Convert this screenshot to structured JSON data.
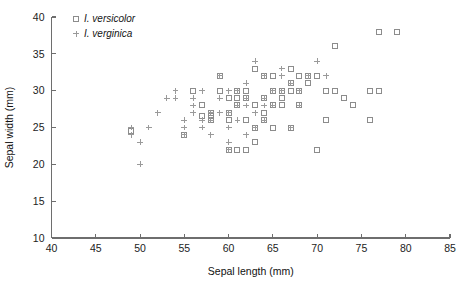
{
  "chart_data": {
    "type": "scatter",
    "title": "",
    "xlabel": "Sepal length (mm)",
    "ylabel": "Sepal width (mm)",
    "xlim": [
      40,
      85
    ],
    "ylim": [
      10,
      40
    ],
    "xticks": [
      40,
      45,
      50,
      55,
      60,
      65,
      70,
      75,
      80,
      85
    ],
    "yticks": [
      10,
      15,
      20,
      25,
      30,
      35,
      40
    ],
    "grid": false,
    "legend_position": "top-left",
    "series": [
      {
        "name": "I. versicolor",
        "marker": "square",
        "color": "#8c8c8c",
        "points": [
          [
            49,
            24.5
          ],
          [
            57,
            26.5
          ],
          [
            58,
            26.5
          ],
          [
            60,
            22.0
          ],
          [
            61,
            22.0
          ],
          [
            58,
            27.0
          ],
          [
            59,
            30.0
          ],
          [
            60,
            27.0
          ],
          [
            61,
            28.0
          ],
          [
            62,
            29.0
          ],
          [
            63,
            25.0
          ],
          [
            64,
            29.0
          ],
          [
            65,
            28.0
          ],
          [
            66,
            30.0
          ],
          [
            67,
            30.0
          ],
          [
            60,
            29.0
          ],
          [
            61,
            30.0
          ],
          [
            62,
            22.0
          ],
          [
            63,
            23.0
          ],
          [
            64,
            32.0
          ],
          [
            65,
            30.0
          ],
          [
            66,
            29.0
          ],
          [
            67,
            31.0
          ],
          [
            68,
            28.0
          ],
          [
            69,
            31.0
          ],
          [
            70,
            32.0
          ],
          [
            71,
            30.0
          ],
          [
            72,
            36.0
          ],
          [
            70,
            22.0
          ],
          [
            63,
            33.0
          ],
          [
            64,
            26.0
          ],
          [
            66,
            30.0
          ],
          [
            56,
            30.0
          ],
          [
            57,
            28.0
          ],
          [
            55,
            24.0
          ],
          [
            58,
            26.0
          ],
          [
            59,
            32.0
          ],
          [
            61,
            29.0
          ],
          [
            62,
            30.0
          ],
          [
            63,
            28.0
          ],
          [
            65,
            32.0
          ],
          [
            67,
            33.0
          ],
          [
            68,
            30.0
          ],
          [
            76,
            30.0
          ],
          [
            77,
            30.0
          ],
          [
            76,
            26.0
          ],
          [
            77,
            38.0
          ],
          [
            79,
            38.0
          ],
          [
            73,
            29.0
          ],
          [
            74,
            28.0
          ],
          [
            72,
            30.0
          ],
          [
            71,
            26.0
          ],
          [
            69,
            32.0
          ],
          [
            68,
            32.0
          ],
          [
            66,
            28.0
          ],
          [
            64,
            27.0
          ],
          [
            62,
            26.0
          ],
          [
            60,
            26.0
          ],
          [
            67,
            25.0
          ],
          [
            65,
            25.0
          ]
        ]
      },
      {
        "name": "I. verginica",
        "marker": "plus",
        "color": "#9a9a9a",
        "points": [
          [
            49,
            25.0
          ],
          [
            49,
            24.0
          ],
          [
            50,
            23.0
          ],
          [
            50,
            20.0
          ],
          [
            51,
            25.0
          ],
          [
            52,
            27.0
          ],
          [
            54,
            30.0
          ],
          [
            55,
            26.0
          ],
          [
            55,
            24.0
          ],
          [
            56,
            29.0
          ],
          [
            56,
            28.0
          ],
          [
            57,
            30.0
          ],
          [
            57,
            26.0
          ],
          [
            57,
            25.0
          ],
          [
            58,
            27.0
          ],
          [
            58,
            26.0
          ],
          [
            59,
            32.0
          ],
          [
            60,
            30.0
          ],
          [
            60,
            27.0
          ],
          [
            60,
            22.0
          ],
          [
            61,
            28.0
          ],
          [
            61,
            30.0
          ],
          [
            62,
            28.0
          ],
          [
            62,
            29.0
          ],
          [
            63,
            34.0
          ],
          [
            63,
            25.0
          ],
          [
            64,
            28.0
          ],
          [
            64,
            32.0
          ],
          [
            65,
            30.0
          ],
          [
            65,
            28.0
          ],
          [
            66,
            30.0
          ],
          [
            67,
            31.0
          ],
          [
            67,
            25.0
          ],
          [
            68,
            30.0
          ],
          [
            69,
            32.0
          ],
          [
            70,
            34.0
          ],
          [
            71,
            32.0
          ],
          [
            55,
            25.0
          ],
          [
            58,
            24.0
          ],
          [
            59,
            27.0
          ],
          [
            61,
            26.0
          ],
          [
            62,
            24.0
          ],
          [
            63,
            27.0
          ],
          [
            64,
            26.0
          ],
          [
            66,
            33.0
          ],
          [
            53,
            29.0
          ],
          [
            54,
            29.0
          ],
          [
            56,
            27.0
          ],
          [
            59,
            29.0
          ],
          [
            60,
            25.0
          ],
          [
            62,
            31.0
          ],
          [
            64,
            29.0
          ],
          [
            66,
            32.0
          ],
          [
            68,
            28.0
          ],
          [
            60,
            23.0
          ]
        ]
      }
    ]
  },
  "legend": {
    "entries": [
      {
        "label": "I. versicolor",
        "marker": "square"
      },
      {
        "label": "I. verginica",
        "marker": "plus"
      }
    ]
  }
}
